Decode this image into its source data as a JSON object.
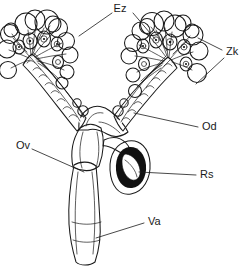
{
  "figure": {
    "background_color": "#ffffff",
    "ink_color": "#1a1a1a",
    "width": 247,
    "height": 273,
    "style": "stippled ink line drawing"
  },
  "labels": [
    {
      "id": "ez",
      "text": "Ez",
      "meaning": "oocyte / egg chamber",
      "x": 120,
      "y": 9,
      "leaders": [
        {
          "x1": 112,
          "y1": 13,
          "x2": 79,
          "y2": 36
        },
        {
          "x1": 133,
          "y1": 13,
          "x2": 156,
          "y2": 40
        }
      ]
    },
    {
      "id": "zk",
      "text": "Zk",
      "meaning": "follicle cell chamber",
      "x": 226,
      "y": 52,
      "leaders": [
        {
          "x1": 222,
          "y1": 50,
          "x2": 198,
          "y2": 38
        },
        {
          "x1": 224,
          "y1": 58,
          "x2": 196,
          "y2": 84
        }
      ]
    },
    {
      "id": "od",
      "text": "Od",
      "meaning": "lateral oviduct",
      "x": 202,
      "y": 127,
      "leaders": [
        {
          "x1": 198,
          "y1": 127,
          "x2": 134,
          "y2": 113
        }
      ]
    },
    {
      "id": "ov",
      "text": "Ov",
      "meaning": "ovary / common oviduct",
      "x": 16,
      "y": 146,
      "leaders": [
        {
          "x1": 32,
          "y1": 149,
          "x2": 84,
          "y2": 172
        }
      ]
    },
    {
      "id": "rs",
      "text": "Rs",
      "meaning": "spermatheca (receptaculum seminis)",
      "x": 200,
      "y": 175,
      "leaders": [
        {
          "x1": 196,
          "y1": 175,
          "x2": 139,
          "y2": 172
        }
      ]
    },
    {
      "id": "va",
      "text": "Va",
      "meaning": "vagina",
      "x": 148,
      "y": 222,
      "leaders": [
        {
          "x1": 144,
          "y1": 223,
          "x2": 96,
          "y2": 238
        }
      ]
    }
  ],
  "structures": [
    {
      "id": "left-ovariole-cluster",
      "name": "left ovariole cluster",
      "count": 13
    },
    {
      "id": "right-ovariole-cluster",
      "name": "right ovariole cluster",
      "count": 14
    },
    {
      "id": "left-lateral-oviduct",
      "name": "left lateral oviduct"
    },
    {
      "id": "right-lateral-oviduct",
      "name": "right lateral oviduct"
    },
    {
      "id": "common-oviduct",
      "name": "common oviduct"
    },
    {
      "id": "spermatheca",
      "name": "spermatheca"
    },
    {
      "id": "vagina",
      "name": "vagina"
    }
  ]
}
